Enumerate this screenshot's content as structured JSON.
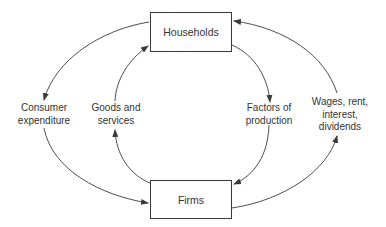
{
  "nodes": {
    "households": "Households",
    "firms": "Firms"
  },
  "flows": {
    "consumer_expenditure": "Consumer\nexpenditure",
    "goods_services": "Goods and\nservices",
    "factors_production": "Factors of\nproduction",
    "wages": "Wages, rent,\ninterest,\ndividends"
  },
  "colors": {
    "line": "#3a3a3a",
    "text": "#333333"
  }
}
